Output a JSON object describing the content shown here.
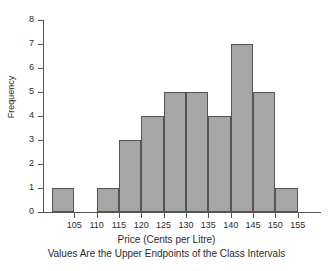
{
  "chart_data": {
    "type": "bar",
    "title": "",
    "xlabel": "Price (Cents per Litre)",
    "ylabel": "Frequency",
    "subtitle": "Values Are the Upper Endpoints of the Class Intervals",
    "categories": [
      "105",
      "110",
      "115",
      "120",
      "125",
      "130",
      "135",
      "140",
      "145",
      "150",
      "155"
    ],
    "bin_upper_endpoints": [
      105,
      110,
      115,
      120,
      125,
      130,
      135,
      140,
      145,
      150,
      155,
      160
    ],
    "bin_lower_endpoints": [
      100,
      105,
      110,
      115,
      120,
      125,
      130,
      135,
      140,
      145,
      150
    ],
    "values": [
      1,
      0,
      1,
      3,
      4,
      5,
      5,
      4,
      7,
      5,
      1
    ],
    "bars": [
      {
        "label": "100-105",
        "value": 1
      },
      {
        "label": "105-110",
        "value": 0
      },
      {
        "label": "110-115",
        "value": 1
      },
      {
        "label": "115-120",
        "value": 3
      },
      {
        "label": "120-125",
        "value": 4
      },
      {
        "label": "125-130",
        "value": 5
      },
      {
        "label": "130-135",
        "value": 5
      },
      {
        "label": "135-140",
        "value": 4
      },
      {
        "label": "140-145",
        "value": 7
      },
      {
        "label": "145-150",
        "value": 5
      },
      {
        "label": "150-155",
        "value": 1
      }
    ],
    "xticks": [
      105,
      110,
      115,
      120,
      125,
      130,
      135,
      140,
      145,
      150,
      155
    ],
    "xticklabels": [
      "105",
      "110",
      "115",
      "120",
      "125",
      "130",
      "135",
      "140",
      "145",
      "150",
      "155"
    ],
    "yticks": [
      0,
      1,
      2,
      3,
      4,
      5,
      6,
      7,
      8
    ],
    "yticklabels": [
      "0",
      "1",
      "2",
      "3",
      "4",
      "5",
      "6",
      "7",
      "8"
    ],
    "ylim": [
      0,
      8
    ],
    "xlim": [
      98,
      160
    ],
    "grid": false,
    "legend": false,
    "bar_fill_color": "#a6a6a6",
    "bar_edge_color": "#555555",
    "axis_color": "#555555",
    "background_color": "#ffffff"
  }
}
